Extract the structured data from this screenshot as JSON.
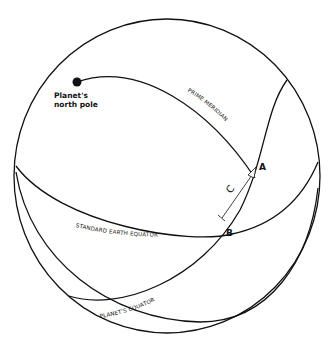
{
  "diagram": {
    "labels": {
      "north_pole_line1": "Planet's",
      "north_pole_line2": "north pole",
      "prime_meridian": "PRIME MERIDIAN",
      "standard_earth_equator": "STANDARD EARTH EQUATOR",
      "planets_equator": "PLANET'S EQUATOR",
      "point_a": "A",
      "point_b": "B",
      "arc_c": "C"
    },
    "colors": {
      "line": "#111111",
      "background": "#ffffff"
    }
  }
}
